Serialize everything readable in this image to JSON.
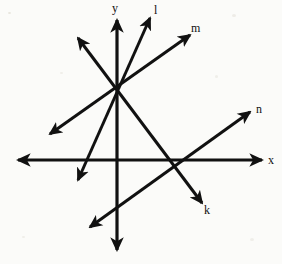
{
  "diagram": {
    "background_color": "#fbfbf9",
    "stroke_color": "#111111",
    "axes": {
      "origin": {
        "x": 118,
        "y": 160
      },
      "x_axis": {
        "name": "x-axis",
        "from": {
          "x": 18,
          "y": 160
        },
        "to": {
          "x": 262,
          "y": 160
        },
        "double_arrow": true,
        "stroke_width": 3.2
      },
      "y_axis": {
        "name": "y-axis",
        "from": {
          "x": 117,
          "y": 20
        },
        "to": {
          "x": 117,
          "y": 250
        },
        "double_arrow": true,
        "stroke_width": 3.2
      }
    },
    "hub": {
      "x": 118,
      "y": 85,
      "note": "concurrency point of lines k, l, m on the y-axis"
    },
    "lines": [
      {
        "id": "l",
        "name": "line-l",
        "from": {
          "x": 150,
          "y": 18
        },
        "to": {
          "x": 78,
          "y": 180
        },
        "double_arrow": true,
        "stroke_width": 3.0
      },
      {
        "id": "m",
        "name": "line-m",
        "from": {
          "x": 190,
          "y": 35
        },
        "to": {
          "x": 50,
          "y": 134
        },
        "double_arrow": true,
        "stroke_width": 3.0
      },
      {
        "id": "k",
        "name": "line-k",
        "from": {
          "x": 78,
          "y": 38
        },
        "to": {
          "x": 202,
          "y": 203
        },
        "double_arrow": true,
        "stroke_width": 3.0
      },
      {
        "id": "n",
        "name": "line-n",
        "from": {
          "x": 250,
          "y": 112
        },
        "to": {
          "x": 90,
          "y": 227
        },
        "double_arrow": true,
        "stroke_width": 3.0
      }
    ],
    "labels": [
      {
        "id": "y",
        "name": "axis-label-y",
        "text": "y",
        "x": 112,
        "y": 2
      },
      {
        "id": "l",
        "name": "line-label-l",
        "text": "l",
        "x": 154,
        "y": 4
      },
      {
        "id": "m",
        "name": "line-label-m",
        "text": "m",
        "x": 191,
        "y": 22
      },
      {
        "id": "n",
        "name": "line-label-n",
        "text": "n",
        "x": 256,
        "y": 103
      },
      {
        "id": "x",
        "name": "axis-label-x",
        "text": "x",
        "x": 268,
        "y": 154
      },
      {
        "id": "k",
        "name": "line-label-k",
        "text": "k",
        "x": 204,
        "y": 204
      }
    ]
  }
}
